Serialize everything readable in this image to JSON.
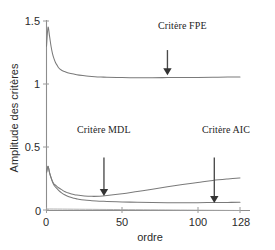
{
  "chart_data": {
    "type": "line",
    "title": "",
    "xlabel": "ordre",
    "ylabel": "Amplitude des critères",
    "xlim": [
      0,
      128
    ],
    "ylim": [
      0,
      1.5
    ],
    "xticks": [
      0,
      50,
      100,
      128
    ],
    "xtick_labels": [
      "0",
      "50",
      "100",
      "128"
    ],
    "yticks": [
      0,
      0.5,
      1,
      1.5
    ],
    "ytick_labels": [
      "0",
      "0.5",
      "1",
      "1.5"
    ],
    "grid": false,
    "legend_position": "annotations",
    "series": [
      {
        "name": "Critère FPE",
        "color": "#7a7a7a",
        "x": [
          0,
          1,
          2,
          3,
          4,
          5,
          6,
          7,
          8,
          10,
          12,
          14,
          16,
          18,
          20,
          24,
          28,
          32,
          36,
          40,
          50,
          60,
          70,
          80,
          90,
          100,
          110,
          120,
          128
        ],
        "values": [
          1.3,
          1.45,
          1.38,
          1.3,
          1.24,
          1.2,
          1.17,
          1.15,
          1.13,
          1.11,
          1.1,
          1.09,
          1.085,
          1.08,
          1.075,
          1.068,
          1.062,
          1.058,
          1.056,
          1.055,
          1.052,
          1.051,
          1.051,
          1.052,
          1.053,
          1.053,
          1.054,
          1.056,
          1.057
        ]
      },
      {
        "name": "Critère AIC",
        "color": "#7a7a7a",
        "x": [
          0,
          1,
          2,
          3,
          4,
          5,
          6,
          8,
          10,
          12,
          14,
          16,
          18,
          20,
          25,
          30,
          35,
          40,
          50,
          60,
          70,
          80,
          90,
          100,
          110,
          120,
          128
        ],
        "values": [
          0.3,
          0.35,
          0.3,
          0.26,
          0.23,
          0.21,
          0.2,
          0.18,
          0.165,
          0.15,
          0.14,
          0.132,
          0.127,
          0.122,
          0.115,
          0.112,
          0.113,
          0.118,
          0.132,
          0.15,
          0.168,
          0.188,
          0.206,
          0.222,
          0.238,
          0.25,
          0.258
        ]
      },
      {
        "name": "Critère MDL",
        "color": "#7a7a7a",
        "x": [
          0,
          1,
          2,
          3,
          4,
          5,
          6,
          8,
          10,
          12,
          14,
          16,
          18,
          20,
          25,
          30,
          35,
          40,
          50,
          60,
          70,
          80,
          90,
          100,
          110,
          120,
          128
        ],
        "values": [
          0.3,
          0.35,
          0.3,
          0.26,
          0.225,
          0.2,
          0.185,
          0.16,
          0.14,
          0.125,
          0.113,
          0.104,
          0.097,
          0.092,
          0.083,
          0.078,
          0.074,
          0.072,
          0.068,
          0.065,
          0.063,
          0.062,
          0.062,
          0.062,
          0.063,
          0.064,
          0.066
        ]
      },
      {
        "name": "baseline",
        "color": "#9e9e9e",
        "x": [
          0,
          128
        ],
        "values": [
          0.012,
          0.0
        ]
      }
    ],
    "annotations": [
      {
        "id": "fpe",
        "text": "Critère FPE",
        "points_to_series": "Critère FPE",
        "arrow_x_order": 80,
        "arrow_from_value": 1.27,
        "arrow_to_value": 1.07
      },
      {
        "id": "mdl",
        "text": "Critère MDL",
        "points_to_series": "Critère MDL",
        "arrow_x_order": 38,
        "arrow_from_value": 0.42,
        "arrow_to_value": 0.115
      },
      {
        "id": "aic",
        "text": "Critère AIC",
        "points_to_series": "Critère AIC",
        "arrow_x_order": 111,
        "arrow_from_value": 0.42,
        "arrow_to_value": 0.06
      }
    ]
  },
  "axis": {
    "ylabel": "Amplitude des critères",
    "xlabel": "ordre",
    "ytick_1_5": "1.5",
    "ytick_1": "1",
    "ytick_0_5": "0.5",
    "ytick_0": "0",
    "xtick_0": "0",
    "xtick_50": "50",
    "xtick_100": "100",
    "xtick_128": "128"
  },
  "annotations": {
    "fpe": "Critère FPE",
    "mdl": "Critère MDL",
    "aic": "Critère AIC"
  },
  "colors": {
    "curve": "#7a7a7a",
    "axis": "#8d8d8d",
    "arrow": "#333333",
    "text": "#242424",
    "background": "#ffffff"
  }
}
